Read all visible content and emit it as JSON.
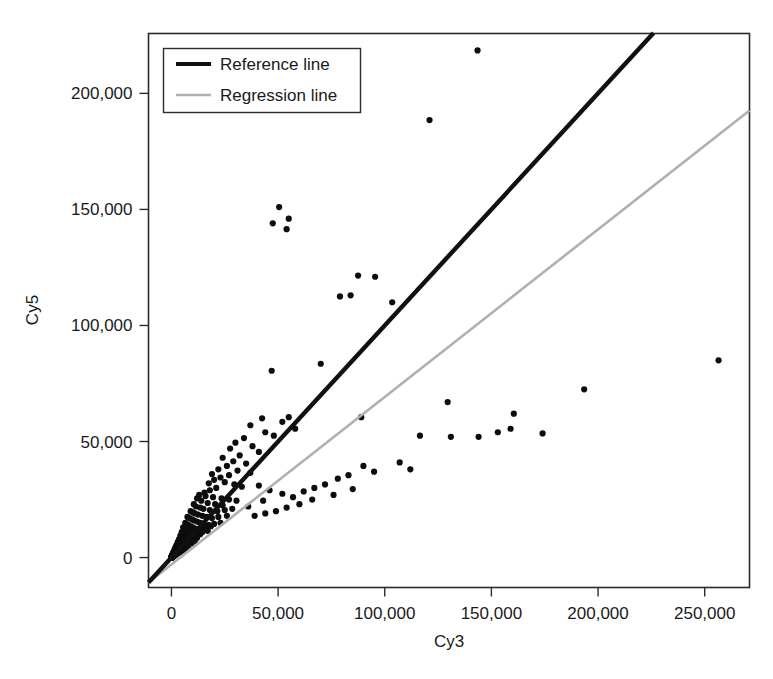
{
  "chart_data": {
    "type": "scatter",
    "title": "",
    "xlabel": "Cy3",
    "ylabel": "Cy5",
    "xlim": [
      -10750,
      271000
    ],
    "ylim": [
      -12900,
      225800
    ],
    "xticks": [
      0,
      50000,
      100000,
      150000,
      200000,
      250000
    ],
    "xtick_labels": [
      "0",
      "50,000",
      "100,000",
      "150,000",
      "200,000",
      "250,000"
    ],
    "yticks": [
      0,
      50000,
      100000,
      150000,
      200000
    ],
    "ytick_labels": [
      "0",
      "50,000",
      "100,000",
      "150,000",
      "200,000"
    ],
    "grid": false,
    "legend_position": "top-left",
    "legend": [
      {
        "label": "Reference line",
        "color": "#111111",
        "type": "line",
        "width": 4.2
      },
      {
        "label": "Regression line",
        "color": "#b0b0b0",
        "type": "line",
        "width": 2.6
      }
    ],
    "lines": [
      {
        "name": "Reference line",
        "color": "#111111",
        "slope": 1.0,
        "intercept": 0,
        "x_start": -10750,
        "x_end": 226000,
        "y_start": -10750,
        "y_end": 226000
      },
      {
        "name": "Regression line",
        "color": "#b0b0b0",
        "slope": 0.722,
        "intercept": -3000,
        "x_start": -10750,
        "x_end": 271000,
        "y_start": -10762,
        "y_end": 192662
      }
    ],
    "point_color": "#0d0d0d",
    "point_radius": 3.1,
    "n_points": 268,
    "points": [
      [
        143500,
        218500
      ],
      [
        121000,
        188500
      ],
      [
        50500,
        151000
      ],
      [
        47500,
        144000
      ],
      [
        55000,
        146000
      ],
      [
        54000,
        141500
      ],
      [
        87500,
        121500
      ],
      [
        95500,
        121000
      ],
      [
        84000,
        113000
      ],
      [
        79000,
        112500
      ],
      [
        103500,
        110000
      ],
      [
        70000,
        83500
      ],
      [
        47000,
        80500
      ],
      [
        256500,
        85000
      ],
      [
        193500,
        72500
      ],
      [
        129500,
        67000
      ],
      [
        160500,
        62000
      ],
      [
        89000,
        60500
      ],
      [
        159000,
        55500
      ],
      [
        174000,
        53500
      ],
      [
        116500,
        52500
      ],
      [
        131000,
        52000
      ],
      [
        144000,
        52000
      ],
      [
        153000,
        54000
      ],
      [
        55000,
        60500
      ],
      [
        52000,
        58500
      ],
      [
        42500,
        60000
      ],
      [
        37000,
        57000
      ],
      [
        44000,
        54000
      ],
      [
        48000,
        52500
      ],
      [
        58000,
        55500
      ],
      [
        34000,
        51500
      ],
      [
        30000,
        49500
      ],
      [
        27500,
        47000
      ],
      [
        38000,
        48000
      ],
      [
        41000,
        45500
      ],
      [
        32000,
        44000
      ],
      [
        24000,
        43000
      ],
      [
        29000,
        41500
      ],
      [
        35000,
        40500
      ],
      [
        26000,
        39500
      ],
      [
        22000,
        38000
      ],
      [
        19000,
        36000
      ],
      [
        31000,
        37500
      ],
      [
        37000,
        36500
      ],
      [
        27000,
        35500
      ],
      [
        23000,
        34500
      ],
      [
        20000,
        33500
      ],
      [
        17500,
        32000
      ],
      [
        25000,
        32500
      ],
      [
        29500,
        31500
      ],
      [
        33000,
        30500
      ],
      [
        21000,
        30000
      ],
      [
        18000,
        29000
      ],
      [
        15500,
        28000
      ],
      [
        13000,
        27000
      ],
      [
        16000,
        26500
      ],
      [
        19500,
        26000
      ],
      [
        23500,
        25500
      ],
      [
        27000,
        25000
      ],
      [
        30500,
        24500
      ],
      [
        12000,
        25500
      ],
      [
        14000,
        24500
      ],
      [
        17000,
        23500
      ],
      [
        20500,
        23000
      ],
      [
        24000,
        22500
      ],
      [
        10500,
        23000
      ],
      [
        11500,
        22000
      ],
      [
        13500,
        21500
      ],
      [
        15000,
        21000
      ],
      [
        18000,
        20500
      ],
      [
        21500,
        20000
      ],
      [
        25000,
        20500
      ],
      [
        28500,
        21000
      ],
      [
        9000,
        20000
      ],
      [
        10000,
        19500
      ],
      [
        11000,
        19000
      ],
      [
        12500,
        18500
      ],
      [
        14500,
        18000
      ],
      [
        16500,
        17500
      ],
      [
        19000,
        17000
      ],
      [
        22000,
        17500
      ],
      [
        26000,
        18000
      ],
      [
        7500,
        17500
      ],
      [
        8500,
        17000
      ],
      [
        9500,
        16500
      ],
      [
        10500,
        16000
      ],
      [
        12000,
        15500
      ],
      [
        13500,
        15000
      ],
      [
        15500,
        14500
      ],
      [
        17500,
        14000
      ],
      [
        20000,
        14500
      ],
      [
        23000,
        15000
      ],
      [
        6500,
        15000
      ],
      [
        7000,
        14500
      ],
      [
        8000,
        14000
      ],
      [
        9000,
        13500
      ],
      [
        10000,
        13000
      ],
      [
        11000,
        12500
      ],
      [
        12500,
        12000
      ],
      [
        14000,
        12500
      ],
      [
        16000,
        13000
      ],
      [
        18500,
        13500
      ],
      [
        5500,
        13000
      ],
      [
        6000,
        12500
      ],
      [
        6800,
        12000
      ],
      [
        7800,
        11500
      ],
      [
        8800,
        11000
      ],
      [
        9800,
        10500
      ],
      [
        11000,
        10000
      ],
      [
        12500,
        10500
      ],
      [
        14500,
        11000
      ],
      [
        17000,
        11500
      ],
      [
        4800,
        11000
      ],
      [
        5200,
        10500
      ],
      [
        5800,
        10000
      ],
      [
        6500,
        9500
      ],
      [
        7200,
        9000
      ],
      [
        8000,
        8800
      ],
      [
        9000,
        8500
      ],
      [
        10200,
        9000
      ],
      [
        11800,
        9500
      ],
      [
        13500,
        10000
      ],
      [
        4200,
        9500
      ],
      [
        4600,
        9000
      ],
      [
        5000,
        8600
      ],
      [
        5500,
        8200
      ],
      [
        6200,
        7800
      ],
      [
        7000,
        7500
      ],
      [
        8000,
        7200
      ],
      [
        9200,
        7600
      ],
      [
        10500,
        8000
      ],
      [
        12000,
        8500
      ],
      [
        3600,
        8000
      ],
      [
        3900,
        7600
      ],
      [
        4300,
        7200
      ],
      [
        4800,
        6900
      ],
      [
        5400,
        6600
      ],
      [
        6100,
        6300
      ],
      [
        7000,
        6000
      ],
      [
        8200,
        6400
      ],
      [
        9500,
        6800
      ],
      [
        11000,
        7200
      ],
      [
        3000,
        6800
      ],
      [
        3300,
        6400
      ],
      [
        3600,
        6100
      ],
      [
        4000,
        5800
      ],
      [
        4500,
        5500
      ],
      [
        5100,
        5200
      ],
      [
        5900,
        5000
      ],
      [
        6900,
        5400
      ],
      [
        8000,
        5800
      ],
      [
        9500,
        6200
      ],
      [
        2500,
        5600
      ],
      [
        2700,
        5300
      ],
      [
        3000,
        5000
      ],
      [
        3400,
        4800
      ],
      [
        3800,
        4500
      ],
      [
        4300,
        4300
      ],
      [
        5000,
        4100
      ],
      [
        5800,
        4400
      ],
      [
        6800,
        4800
      ],
      [
        8000,
        5200
      ],
      [
        2000,
        4600
      ],
      [
        2200,
        4300
      ],
      [
        2500,
        4100
      ],
      [
        2800,
        3900
      ],
      [
        3200,
        3700
      ],
      [
        3600,
        3500
      ],
      [
        4200,
        3300
      ],
      [
        4900,
        3600
      ],
      [
        5800,
        3900
      ],
      [
        6800,
        4200
      ],
      [
        1600,
        3700
      ],
      [
        1800,
        3500
      ],
      [
        2000,
        3300
      ],
      [
        2300,
        3100
      ],
      [
        2600,
        2900
      ],
      [
        3000,
        2800
      ],
      [
        3500,
        2700
      ],
      [
        4100,
        2900
      ],
      [
        4800,
        3100
      ],
      [
        5600,
        3400
      ],
      [
        1200,
        2900
      ],
      [
        1400,
        2700
      ],
      [
        1600,
        2600
      ],
      [
        1800,
        2400
      ],
      [
        2100,
        2300
      ],
      [
        2400,
        2200
      ],
      [
        2800,
        2100
      ],
      [
        3300,
        2300
      ],
      [
        3900,
        2500
      ],
      [
        4600,
        2700
      ],
      [
        900,
        2200
      ],
      [
        1050,
        2100
      ],
      [
        1200,
        2000
      ],
      [
        1400,
        1900
      ],
      [
        1600,
        1800
      ],
      [
        1850,
        1700
      ],
      [
        2150,
        1650
      ],
      [
        2500,
        1800
      ],
      [
        2950,
        1950
      ],
      [
        3500,
        2100
      ],
      [
        650,
        1700
      ],
      [
        780,
        1600
      ],
      [
        900,
        1500
      ],
      [
        1050,
        1400
      ],
      [
        1200,
        1350
      ],
      [
        1400,
        1300
      ],
      [
        1650,
        1250
      ],
      [
        1900,
        1350
      ],
      [
        2250,
        1500
      ],
      [
        2650,
        1650
      ],
      [
        450,
        1250
      ],
      [
        550,
        1180
      ],
      [
        650,
        1100
      ],
      [
        780,
        1050
      ],
      [
        900,
        1000
      ],
      [
        1050,
        950
      ],
      [
        1250,
        900
      ],
      [
        1450,
        1000
      ],
      [
        1700,
        1100
      ],
      [
        2000,
        1200
      ],
      [
        300,
        900
      ],
      [
        380,
        850
      ],
      [
        460,
        800
      ],
      [
        550,
        760
      ],
      [
        650,
        720
      ],
      [
        780,
        680
      ],
      [
        920,
        650
      ],
      [
        1080,
        720
      ],
      [
        1270,
        800
      ],
      [
        1500,
        880
      ],
      [
        180,
        600
      ],
      [
        240,
        560
      ],
      [
        300,
        520
      ],
      [
        370,
        490
      ],
      [
        450,
        460
      ],
      [
        540,
        440
      ],
      [
        650,
        420
      ],
      [
        780,
        470
      ],
      [
        920,
        520
      ],
      [
        1100,
        580
      ],
      [
        100,
        380
      ],
      [
        140,
        350
      ],
      [
        190,
        330
      ],
      [
        240,
        310
      ],
      [
        300,
        290
      ],
      [
        370,
        275
      ],
      [
        450,
        260
      ],
      [
        540,
        290
      ],
      [
        650,
        330
      ],
      [
        780,
        370
      ],
      [
        60,
        220
      ],
      [
        85,
        200
      ],
      [
        115,
        185
      ],
      [
        150,
        175
      ],
      [
        190,
        165
      ],
      [
        240,
        155
      ],
      [
        300,
        150
      ],
      [
        370,
        170
      ],
      [
        450,
        195
      ],
      [
        550,
        220
      ],
      [
        30,
        110
      ],
      [
        45,
        100
      ],
      [
        65,
        92
      ],
      [
        88,
        85
      ],
      [
        115,
        80
      ],
      [
        148,
        75
      ],
      [
        185,
        72
      ],
      [
        230,
        85
      ],
      [
        285,
        100
      ],
      [
        350,
        115
      ],
      [
        10,
        40
      ],
      [
        18,
        35
      ],
      [
        28,
        32
      ],
      [
        40,
        28
      ],
      [
        55,
        26
      ],
      [
        72,
        24
      ],
      [
        95,
        22
      ],
      [
        120,
        28
      ],
      [
        155,
        34
      ],
      [
        195,
        42
      ],
      [
        41000,
        31000
      ],
      [
        46000,
        29000
      ],
      [
        52000,
        27500
      ],
      [
        57000,
        26000
      ],
      [
        62000,
        28500
      ],
      [
        67000,
        30000
      ],
      [
        72000,
        31500
      ],
      [
        78000,
        34000
      ],
      [
        83000,
        35500
      ],
      [
        90000,
        39500
      ],
      [
        95000,
        37000
      ],
      [
        66000,
        25000
      ],
      [
        60000,
        23000
      ],
      [
        54000,
        21500
      ],
      [
        49000,
        20000
      ],
      [
        44000,
        19000
      ],
      [
        39000,
        18000
      ],
      [
        36000,
        22000
      ],
      [
        43000,
        24500
      ],
      [
        76000,
        27000
      ],
      [
        85000,
        29500
      ],
      [
        107000,
        41000
      ],
      [
        112000,
        38000
      ]
    ]
  },
  "axes": {
    "x_title": "Cy3",
    "y_title": "Cy5"
  }
}
